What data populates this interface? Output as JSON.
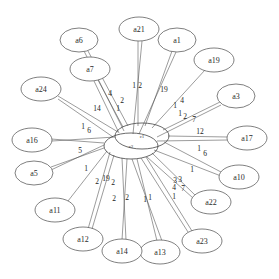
{
  "diagram": {
    "type": "radial-network",
    "background_color": "#ffffff",
    "node_fill": "#ffffff",
    "node_stroke": "#555555",
    "edge_stroke": "#4a4a4a",
    "label_color": "#2b2b2b"
  },
  "center_nodes": [
    {
      "id": "c1",
      "label": "c1",
      "cx": 142,
      "cy": 136,
      "rx": 27,
      "ry": 13
    },
    {
      "id": "c2",
      "label": "c2",
      "cx": 131,
      "cy": 146,
      "rx": 27,
      "ry": 13
    }
  ],
  "nodes": [
    {
      "id": "a21",
      "label": "a21",
      "cx": 139,
      "cy": 29,
      "rx": 20,
      "ry": 12
    },
    {
      "id": "a1",
      "label": "a1",
      "cx": 177,
      "cy": 40,
      "rx": 19,
      "ry": 12
    },
    {
      "id": "a19",
      "label": "a19",
      "cx": 214,
      "cy": 60,
      "rx": 20,
      "ry": 12
    },
    {
      "id": "a3",
      "label": "a3",
      "cx": 236,
      "cy": 96,
      "rx": 19,
      "ry": 12
    },
    {
      "id": "a17",
      "label": "a17",
      "cx": 247,
      "cy": 138,
      "rx": 20,
      "ry": 12
    },
    {
      "id": "a10",
      "label": "a10",
      "cx": 239,
      "cy": 177,
      "rx": 20,
      "ry": 12
    },
    {
      "id": "a22",
      "label": "a22",
      "cx": 211,
      "cy": 202,
      "rx": 20,
      "ry": 12
    },
    {
      "id": "a23",
      "label": "a23",
      "cx": 202,
      "cy": 241,
      "rx": 20,
      "ry": 12
    },
    {
      "id": "a13",
      "label": "a13",
      "cx": 160,
      "cy": 252,
      "rx": 20,
      "ry": 12
    },
    {
      "id": "a14",
      "label": "a14",
      "cx": 122,
      "cy": 251,
      "rx": 20,
      "ry": 12
    },
    {
      "id": "a12",
      "label": "a12",
      "cx": 83,
      "cy": 239,
      "rx": 20,
      "ry": 12
    },
    {
      "id": "a11",
      "label": "a11",
      "cx": 55,
      "cy": 210,
      "rx": 20,
      "ry": 12
    },
    {
      "id": "a5",
      "label": "a5",
      "cx": 34,
      "cy": 173,
      "rx": 19,
      "ry": 12
    },
    {
      "id": "a16",
      "label": "a16",
      "cx": 32,
      "cy": 140,
      "rx": 20,
      "ry": 12
    },
    {
      "id": "a24",
      "label": "a24",
      "cx": 41,
      "cy": 89,
      "rx": 20,
      "ry": 12
    },
    {
      "id": "a7",
      "label": "a7",
      "cx": 90,
      "cy": 69,
      "rx": 20,
      "ry": 12
    },
    {
      "id": "a6",
      "label": "a6",
      "cx": 79,
      "cy": 40,
      "rx": 19,
      "ry": 12
    }
  ],
  "edges": [
    {
      "from": "c1",
      "to": "a21",
      "sx": 138,
      "sy": 126,
      "ex": 138,
      "ey": 41
    },
    {
      "from": "c2",
      "to": "a21",
      "sx": 133,
      "sy": 134,
      "ex": 142,
      "ey": 41
    },
    {
      "from": "c1",
      "to": "a1",
      "sx": 145,
      "sy": 126,
      "ex": 172,
      "ey": 51
    },
    {
      "from": "c2",
      "to": "a1",
      "sx": 139,
      "sy": 134,
      "ex": 176,
      "ey": 52
    },
    {
      "from": "c1",
      "to": "a19",
      "sx": 152,
      "sy": 128,
      "ex": 205,
      "ey": 70
    },
    {
      "from": "c1",
      "to": "a3",
      "sx": 163,
      "sy": 130,
      "ex": 220,
      "ey": 102
    },
    {
      "from": "c2",
      "to": "a3",
      "sx": 157,
      "sy": 137,
      "ex": 221,
      "ey": 105
    },
    {
      "from": "c1",
      "to": "a17",
      "sx": 168,
      "sy": 136,
      "ex": 228,
      "ey": 137
    },
    {
      "from": "c2",
      "to": "a17",
      "sx": 157,
      "sy": 141,
      "ex": 228,
      "ey": 140
    },
    {
      "from": "c1",
      "to": "a10",
      "sx": 164,
      "sy": 142,
      "ex": 221,
      "ey": 172
    },
    {
      "from": "c2",
      "to": "a10",
      "sx": 154,
      "sy": 150,
      "ex": 221,
      "ey": 176
    },
    {
      "from": "c2",
      "to": "a22",
      "sx": 152,
      "sy": 153,
      "ex": 196,
      "ey": 196
    },
    {
      "from": "c2",
      "to": "a22",
      "sx": 147,
      "sy": 157,
      "ex": 193,
      "ey": 198
    },
    {
      "from": "c2",
      "to": "a23",
      "sx": 146,
      "sy": 157,
      "ex": 192,
      "ey": 231
    },
    {
      "from": "c2",
      "to": "a23",
      "sx": 141,
      "sy": 158,
      "ex": 188,
      "ey": 232
    },
    {
      "from": "c2",
      "to": "a13",
      "sx": 137,
      "sy": 159,
      "ex": 157,
      "ey": 241
    },
    {
      "from": "c2",
      "to": "a13",
      "sx": 132,
      "sy": 159,
      "ex": 162,
      "ey": 241
    },
    {
      "from": "c2",
      "to": "a14",
      "sx": 127,
      "sy": 159,
      "ex": 122,
      "ey": 240
    },
    {
      "from": "c2",
      "to": "a14",
      "sx": 122,
      "sy": 158,
      "ex": 126,
      "ey": 240
    },
    {
      "from": "c2",
      "to": "a12",
      "sx": 114,
      "sy": 155,
      "ex": 92,
      "ey": 229
    },
    {
      "from": "c2",
      "to": "a12",
      "sx": 110,
      "sy": 152,
      "ex": 88,
      "ey": 229
    },
    {
      "from": "c2",
      "to": "a11",
      "sx": 107,
      "sy": 151,
      "ex": 68,
      "ey": 201
    },
    {
      "from": "c2",
      "to": "a5",
      "sx": 104,
      "sy": 148,
      "ex": 51,
      "ey": 167
    },
    {
      "from": "c2",
      "to": "a5",
      "sx": 104,
      "sy": 145,
      "ex": 51,
      "ey": 170
    },
    {
      "from": "c2",
      "to": "a16",
      "sx": 104,
      "sy": 143,
      "ex": 51,
      "ey": 139
    },
    {
      "from": "c1",
      "to": "a16",
      "sx": 115,
      "sy": 137,
      "ex": 52,
      "ey": 141
    },
    {
      "from": "c1",
      "to": "a24",
      "sx": 118,
      "sy": 132,
      "ex": 58,
      "ey": 96
    },
    {
      "from": "c2",
      "to": "a24",
      "sx": 113,
      "sy": 137,
      "ex": 58,
      "ey": 99
    },
    {
      "from": "c1",
      "to": "a7",
      "sx": 123,
      "sy": 127,
      "ex": 98,
      "ey": 80
    },
    {
      "from": "c2",
      "to": "a7",
      "sx": 119,
      "sy": 133,
      "ex": 94,
      "ey": 81
    },
    {
      "from": "c1",
      "to": "a6",
      "sx": 128,
      "sy": 126,
      "ex": 88,
      "ey": 51
    },
    {
      "from": "c2",
      "to": "a6",
      "sx": 124,
      "sy": 131,
      "ex": 84,
      "ey": 51
    }
  ],
  "edge_labels": [
    {
      "text": "1",
      "x": 134,
      "y": 85
    },
    {
      "text": "2",
      "x": 140,
      "y": 85
    },
    {
      "text": "19",
      "x": 164,
      "y": 89
    },
    {
      "text": "1",
      "x": 175,
      "y": 105
    },
    {
      "text": "4",
      "x": 182,
      "y": 100
    },
    {
      "text": "1",
      "x": 180,
      "y": 113
    },
    {
      "text": "2",
      "x": 185,
      "y": 116
    },
    {
      "text": "7",
      "x": 194,
      "y": 119
    },
    {
      "text": "12",
      "x": 200,
      "y": 131
    },
    {
      "text": "1",
      "x": 199,
      "y": 148
    },
    {
      "text": "6",
      "x": 205,
      "y": 153
    },
    {
      "text": "1",
      "x": 192,
      "y": 169
    },
    {
      "text": "3",
      "x": 175,
      "y": 180
    },
    {
      "text": "3",
      "x": 180,
      "y": 179
    },
    {
      "text": "4",
      "x": 174,
      "y": 187
    },
    {
      "text": "7",
      "x": 183,
      "y": 188
    },
    {
      "text": "1",
      "x": 174,
      "y": 196
    },
    {
      "text": "1",
      "x": 145,
      "y": 199
    },
    {
      "text": "1",
      "x": 150,
      "y": 197
    },
    {
      "text": "2",
      "x": 127,
      "y": 197
    },
    {
      "text": "2",
      "x": 114,
      "y": 198
    },
    {
      "text": "2",
      "x": 113,
      "y": 182
    },
    {
      "text": "2",
      "x": 97,
      "y": 181
    },
    {
      "text": "19",
      "x": 106,
      "y": 178
    },
    {
      "text": "1",
      "x": 86,
      "y": 168
    },
    {
      "text": "5",
      "x": 80,
      "y": 150
    },
    {
      "text": "1",
      "x": 83,
      "y": 126
    },
    {
      "text": "6",
      "x": 89,
      "y": 130
    },
    {
      "text": "14",
      "x": 97,
      "y": 108
    },
    {
      "text": "4",
      "x": 110,
      "y": 93
    },
    {
      "text": "1",
      "x": 118,
      "y": 108
    },
    {
      "text": "2",
      "x": 122,
      "y": 100
    }
  ]
}
